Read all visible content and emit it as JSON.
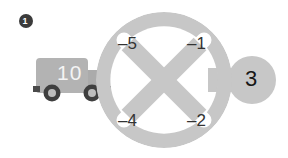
{
  "page": {
    "background_color": "#ffffff",
    "width": 288,
    "height": 158
  },
  "bullet": {
    "name": "item-number-bullet",
    "number": "1",
    "circle_color": "#3b3b3b",
    "text_color": "#ffffff"
  },
  "truck": {
    "name": "truck-shape",
    "body_color": "#b3b3b3",
    "cab_color": "#b0b0b0",
    "wheel_color": "#4a4a4a",
    "hub_color": "#bdbdbd",
    "number": "10",
    "number_color": "#f4f4f4"
  },
  "wheel_node": {
    "name": "wheel-circle-node",
    "fill_color": "#c7c7c7",
    "cutout_color": "#ffffff",
    "quadrant_labels": [
      {
        "id": "top-left",
        "text": "–5"
      },
      {
        "id": "top-right",
        "text": "–1"
      },
      {
        "id": "bottom-left",
        "text": "–4"
      },
      {
        "id": "bottom-right",
        "text": "–2"
      }
    ]
  },
  "side_node": {
    "name": "side-circle-node",
    "fill_color": "#c7c7c7",
    "number": "3",
    "number_color": "#171717"
  },
  "colors": {
    "gray_shape": "#c7c7c7",
    "gray_truck": "#b3b3b3",
    "dark_ink": "#333333",
    "white": "#ffffff"
  }
}
